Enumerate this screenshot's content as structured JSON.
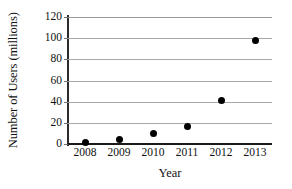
{
  "chart_data": {
    "type": "scatter",
    "title": "",
    "xlabel": "Year",
    "ylabel": "Number of Users (millions)",
    "categories": [
      "2008",
      "2009",
      "2010",
      "2011",
      "2012",
      "2013"
    ],
    "x": [
      2008,
      2009,
      2010,
      2011,
      2012,
      2013
    ],
    "values": [
      1,
      4,
      10,
      17,
      41,
      98
    ],
    "series": [
      {
        "name": "Number of Users",
        "values": [
          1,
          4,
          10,
          17,
          41,
          98
        ]
      }
    ],
    "xlim": [
      2008,
      2013
    ],
    "ylim": [
      0,
      120
    ],
    "y_ticks": [
      0,
      20,
      40,
      60,
      80,
      100,
      120
    ],
    "y_tick_labels": [
      "0",
      "20",
      "40",
      "60",
      "80",
      "100",
      "120"
    ],
    "x_ticks": [
      2008,
      2009,
      2010,
      2011,
      2012,
      2013
    ],
    "x_tick_labels": [
      "2008",
      "2009",
      "2010",
      "2011",
      "2012",
      "2013"
    ],
    "grid": "horizontal",
    "legend": "none",
    "marker": "filled-circle",
    "colors": {
      "marker": "#000000",
      "gridline": "#a9a9a9",
      "axis": "#1a1a1a",
      "background": "#ffffff",
      "text": "#111111"
    }
  }
}
